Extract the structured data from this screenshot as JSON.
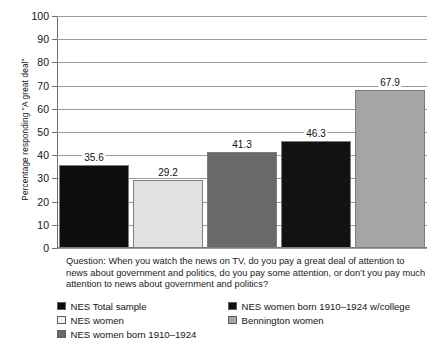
{
  "chart_data": {
    "type": "bar",
    "title": "",
    "xlabel": "",
    "ylabel": "Percentage responding \"A great deal\"",
    "ylim": [
      0,
      100
    ],
    "ytick_step": 10,
    "grid": true,
    "legend_position": "bottom",
    "categories": [
      "NES Total sample",
      "NES women",
      "NES women born 1910–1924",
      "NES women born 1910–1924 w/college",
      "Bennington women"
    ],
    "values": [
      35.6,
      29.2,
      41.3,
      46.3,
      67.9
    ],
    "value_labels": [
      "35.6",
      "29.2",
      "41.3",
      "46.3",
      "67.9"
    ],
    "bar_colors": [
      "#0d0d0d",
      "#e2e2e2",
      "#696969",
      "#121212",
      "#a5a5a5"
    ],
    "ytick_labels": [
      "0",
      "10",
      "20",
      "30",
      "40",
      "50",
      "60",
      "70",
      "80",
      "90",
      "100"
    ],
    "annotations": [
      "Question: When you watch the news on TV, do you pay a great deal of attention to news about government and politics, do you pay some attention, or don’t you pay much attention to news about government and politics?"
    ]
  },
  "caption": {
    "question": "Question: When you watch the news on TV, do you pay a great deal of attention to news about government and politics, do you pay some attention, or don’t you pay much attention to news about government and politics?"
  },
  "legend": {
    "left_column": [
      {
        "label": "NES Total sample",
        "color": "#0d0d0d"
      },
      {
        "label": "NES women",
        "color": "#f2f2f2"
      },
      {
        "label": "NES women born 1910–1924",
        "color": "#696969"
      }
    ],
    "right_column": [
      {
        "label": "NES women born 1910–1924 w/college",
        "color": "#121212"
      },
      {
        "label": "Bennington women",
        "color": "#a5a5a5"
      }
    ]
  }
}
